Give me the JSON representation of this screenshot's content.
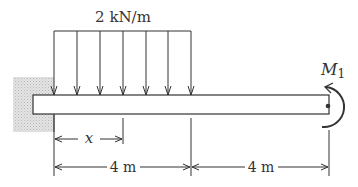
{
  "diagram": {
    "type": "cantilever-beam",
    "load_label": "2 kN/m",
    "moment_label": "M",
    "moment_subscript": "1",
    "x_label": "x",
    "dimensions": [
      {
        "label": "4 m"
      },
      {
        "label": "4 m"
      }
    ],
    "colors": {
      "line": "#333333",
      "wall": "#d8d8d8",
      "beam_fill": "#ffffff"
    }
  }
}
